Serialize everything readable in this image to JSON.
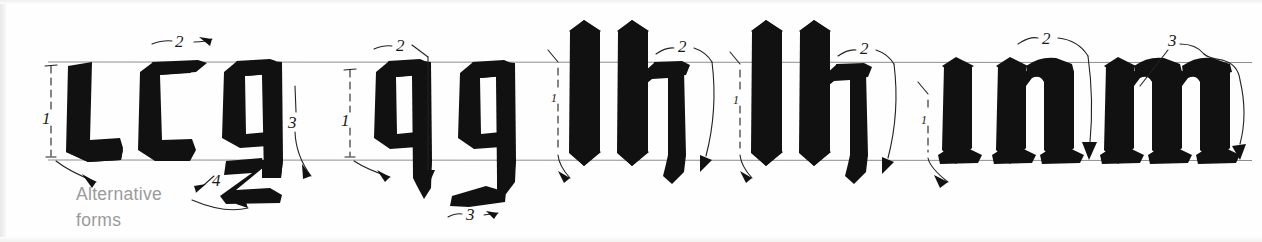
{
  "plate": {
    "title": "Gothic Textura lowercase letter construction",
    "caption_line1": "Alternative",
    "caption_line2": "forms",
    "ink_color": "#111111",
    "guide_color": "#8e8e8e",
    "caption_color": "#9a9a9a",
    "background": "#fefefe"
  },
  "guidelines": {
    "x_height_top_label": "x-height line",
    "baseline_label": "baseline",
    "top_y": 62,
    "bottom_y": 160
  },
  "groups": [
    {
      "name": "group-lcg",
      "letters": [
        "l",
        "c",
        "g"
      ],
      "stroke_numbers": [
        "1",
        "2",
        "3",
        "4"
      ],
      "note": "Alternative forms"
    },
    {
      "name": "group-qg",
      "letters": [
        "q",
        "g"
      ],
      "stroke_numbers": [
        "1",
        "2",
        "3"
      ]
    },
    {
      "name": "group-lh-1",
      "letters": [
        "l",
        "h"
      ],
      "stroke_numbers": [
        "1",
        "2"
      ]
    },
    {
      "name": "group-lh-2",
      "letters": [
        "l",
        "h"
      ],
      "stroke_numbers": [
        "1",
        "2"
      ]
    },
    {
      "name": "group-inm",
      "letters": [
        "i",
        "n",
        "m"
      ],
      "stroke_numbers": [
        "1",
        "2",
        "3"
      ]
    }
  ],
  "annotations": [
    {
      "id": "a1",
      "label": "1",
      "x": 46,
      "y": 118,
      "kind": "height-bracket"
    },
    {
      "id": "a2",
      "label": "2",
      "x": 181,
      "y": 41,
      "kind": "stroke-order"
    },
    {
      "id": "a3",
      "label": "3",
      "x": 295,
      "y": 124,
      "kind": "stroke-order"
    },
    {
      "id": "a4",
      "label": "4",
      "x": 218,
      "y": 182,
      "kind": "stroke-order"
    },
    {
      "id": "a5",
      "label": "1",
      "x": 345,
      "y": 120,
      "kind": "height-bracket"
    },
    {
      "id": "a6",
      "label": "2",
      "x": 402,
      "y": 45,
      "kind": "stroke-order"
    },
    {
      "id": "a7",
      "label": "3",
      "x": 478,
      "y": 213,
      "kind": "stroke-order"
    },
    {
      "id": "a8",
      "label": "1",
      "x": 554,
      "y": 94,
      "kind": "height-bracket"
    },
    {
      "id": "a9",
      "label": "2",
      "x": 682,
      "y": 45,
      "kind": "stroke-order"
    },
    {
      "id": "a10",
      "label": "1",
      "x": 739,
      "y": 97,
      "kind": "height-bracket"
    },
    {
      "id": "a11",
      "label": "2",
      "x": 860,
      "y": 50,
      "kind": "stroke-order"
    },
    {
      "id": "a12",
      "label": "1",
      "x": 928,
      "y": 119,
      "kind": "height-bracket"
    },
    {
      "id": "a13",
      "label": "2",
      "x": 1046,
      "y": 38,
      "kind": "stroke-order"
    },
    {
      "id": "a14",
      "label": "3",
      "x": 1172,
      "y": 42,
      "kind": "stroke-order"
    }
  ]
}
